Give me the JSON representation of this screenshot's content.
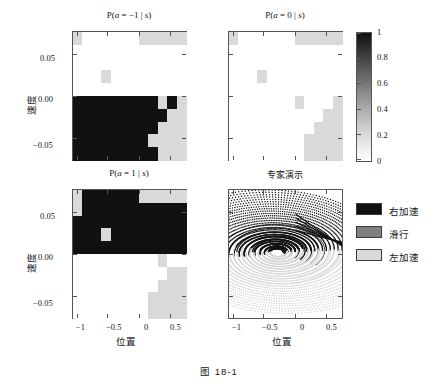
{
  "figure": {
    "caption": "图    18-1",
    "axis_labels": {
      "x": "位置",
      "y": "速度"
    },
    "xticks": [
      "−1",
      "−0.5",
      "0",
      "0.5"
    ],
    "xtick_values": [
      -1,
      -0.5,
      0,
      0.5
    ],
    "yticks": [
      "0.05",
      "0.00",
      "−0.05"
    ],
    "ytick_values": [
      0.05,
      0.0,
      -0.05
    ]
  },
  "colors": {
    "black": "#111111",
    "gray": "#808080",
    "light_gray": "#d9d9d9",
    "white": "#ffffff",
    "axis": "#555555"
  },
  "colorbar": {
    "ticks": [
      "1",
      "0.8",
      "0.6",
      "0.4",
      "0.2",
      "0"
    ],
    "tick_values": [
      1,
      0.8,
      0.6,
      0.4,
      0.2,
      0
    ],
    "vmin": 0,
    "vmax": 1,
    "cmap": "gray_r"
  },
  "legend": {
    "items": [
      {
        "label": "右加速",
        "color": "#111111"
      },
      {
        "label": "滑行",
        "color": "#808080"
      },
      {
        "label": "左加速",
        "color": "#d9d9d9"
      }
    ]
  },
  "panels": [
    {
      "id": "p_a_neg1",
      "title_html": "P(<i>a</i> = −1 | <i>s</i>)",
      "title": "P(a = -1 | s)"
    },
    {
      "id": "p_a_0",
      "title_html": "P(<i>a</i> = 0 | <i>s</i>)",
      "title": "P(a = 0 | s)"
    },
    {
      "id": "p_a_1",
      "title_html": "P(<i>a</i> = 1 | <i>s</i>)",
      "title": "P(a = 1 | s)"
    },
    {
      "id": "expert",
      "title_html": "专家演示",
      "title": "专家演示"
    }
  ],
  "chart_data": [
    {
      "type": "heatmap",
      "title": "P(a = -1 | s)",
      "xlabel": "位置",
      "ylabel": "速度",
      "xlim": [
        -1.2,
        0.6
      ],
      "ylim": [
        -0.07,
        0.07
      ],
      "zlim": [
        0,
        1
      ],
      "ncols": 12,
      "nrows": 10,
      "comment": "rows ordered top (velocity high) to bottom (velocity low); values 0=white,0.5=gray,1=black",
      "values": [
        [
          0.5,
          0,
          0,
          0,
          0,
          0,
          0,
          0.5,
          0.5,
          0.5,
          0.5,
          0.5
        ],
        [
          0,
          0,
          0,
          0,
          0,
          0,
          0,
          0,
          0,
          0,
          0,
          0
        ],
        [
          0,
          0,
          0,
          0,
          0,
          0,
          0,
          0,
          0,
          0,
          0,
          0
        ],
        [
          0,
          0,
          0,
          0.5,
          0,
          0,
          0,
          0,
          0,
          0,
          0,
          0
        ],
        [
          0,
          0,
          0,
          0,
          0,
          0,
          0,
          0,
          0,
          0,
          0,
          0
        ],
        [
          1,
          1,
          1,
          1,
          1,
          1,
          1,
          1,
          1,
          0.5,
          1,
          0.5
        ],
        [
          1,
          1,
          1,
          1,
          1,
          1,
          1,
          1,
          1,
          1,
          0.5,
          0.5
        ],
        [
          1,
          1,
          1,
          1,
          1,
          1,
          1,
          1,
          1,
          0.5,
          0.5,
          0.5
        ],
        [
          1,
          1,
          1,
          1,
          1,
          1,
          1,
          1,
          0.5,
          0.5,
          0.5,
          0.5
        ],
        [
          1,
          1,
          1,
          1,
          1,
          1,
          1,
          1,
          1,
          0.5,
          0.5,
          0.5
        ]
      ]
    },
    {
      "type": "heatmap",
      "title": "P(a = 0 | s)",
      "xlabel": "位置",
      "ylabel": "速度",
      "xlim": [
        -1.2,
        0.6
      ],
      "ylim": [
        -0.07,
        0.07
      ],
      "zlim": [
        0,
        1
      ],
      "ncols": 12,
      "nrows": 10,
      "values": [
        [
          0.5,
          0,
          0,
          0,
          0,
          0,
          0,
          0.5,
          0.5,
          0.5,
          0.5,
          0.5
        ],
        [
          0,
          0,
          0,
          0,
          0,
          0,
          0,
          0,
          0,
          0,
          0,
          0
        ],
        [
          0,
          0,
          0,
          0,
          0,
          0,
          0,
          0,
          0,
          0,
          0,
          0
        ],
        [
          0,
          0,
          0,
          0.5,
          0,
          0,
          0,
          0,
          0,
          0,
          0,
          0
        ],
        [
          0,
          0,
          0,
          0,
          0,
          0,
          0,
          0,
          0,
          0,
          0,
          0
        ],
        [
          0,
          0,
          0,
          0,
          0,
          0,
          0,
          0.5,
          0,
          0,
          0,
          0.5
        ],
        [
          0,
          0,
          0,
          0,
          0,
          0,
          0,
          0,
          0,
          0,
          0.5,
          0.5
        ],
        [
          0,
          0,
          0,
          0,
          0,
          0,
          0,
          0,
          0,
          0.5,
          0.5,
          0.5
        ],
        [
          0,
          0,
          0,
          0,
          0,
          0,
          0,
          0,
          0.5,
          0.5,
          0.5,
          0.5
        ],
        [
          0,
          0,
          0,
          0,
          0,
          0,
          0,
          0,
          0.5,
          0.5,
          0.5,
          0.5
        ]
      ]
    },
    {
      "type": "heatmap",
      "title": "P(a = 1 | s)",
      "xlabel": "位置",
      "ylabel": "速度",
      "xlim": [
        -1.2,
        0.6
      ],
      "ylim": [
        -0.07,
        0.07
      ],
      "zlim": [
        0,
        1
      ],
      "ncols": 12,
      "nrows": 10,
      "values": [
        [
          0.5,
          1,
          1,
          1,
          1,
          1,
          1,
          0.5,
          0.5,
          0.5,
          0.5,
          0.5
        ],
        [
          0.5,
          1,
          1,
          1,
          1,
          1,
          1,
          1,
          1,
          1,
          1,
          1
        ],
        [
          1,
          1,
          1,
          1,
          1,
          1,
          1,
          1,
          1,
          1,
          1,
          1
        ],
        [
          1,
          1,
          1,
          0.5,
          1,
          1,
          1,
          1,
          1,
          1,
          1,
          1
        ],
        [
          1,
          1,
          1,
          1,
          1,
          1,
          1,
          1,
          1,
          1,
          1,
          1
        ],
        [
          0,
          0,
          0,
          0,
          0,
          0,
          0,
          0,
          0,
          0.5,
          0,
          0
        ],
        [
          0,
          0,
          0,
          0,
          0,
          0,
          0,
          0,
          0,
          0,
          0.5,
          0.5
        ],
        [
          0,
          0,
          0,
          0,
          0,
          0,
          0,
          0,
          0,
          0.5,
          0.5,
          0.5
        ],
        [
          0,
          0,
          0,
          0,
          0,
          0,
          0,
          0,
          0.5,
          0.5,
          0.5,
          0.5
        ],
        [
          0,
          0,
          0,
          0,
          0,
          0,
          0,
          0,
          0.5,
          0.5,
          0.5,
          0.5
        ]
      ]
    },
    {
      "type": "scatter",
      "title": "专家演示",
      "xlabel": "位置",
      "ylabel": "速度",
      "xlim": [
        -1.2,
        0.6
      ],
      "ylim": [
        -0.07,
        0.07
      ],
      "comment": "Mountain-car expert demonstration trajectories in phase space; dark dotted spiral arcs (right acceleration) in upper half, light dotted spiral arcs (left acceleration) in lower half, converging to a dense black swirl near position -0.4, velocity 0.005"
    }
  ]
}
